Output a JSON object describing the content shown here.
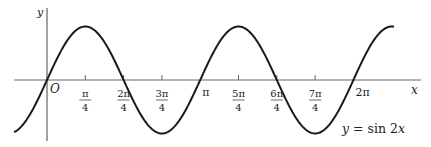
{
  "chart_data": {
    "type": "line",
    "title": "",
    "function_label": "y = sin 2x",
    "xlabel": "x",
    "ylabel": "y",
    "origin_label": "O",
    "x_ticks": [
      {
        "value": 0.7854,
        "num": "π",
        "den": "4"
      },
      {
        "value": 1.5708,
        "num": "2π",
        "den": "4"
      },
      {
        "value": 2.3562,
        "num": "3π",
        "den": "4"
      },
      {
        "value": 3.1416,
        "label": "π"
      },
      {
        "value": 3.927,
        "num": "5π",
        "den": "4"
      },
      {
        "value": 4.7124,
        "num": "6π",
        "den": "4"
      },
      {
        "value": 5.4978,
        "num": "7π",
        "den": "4"
      },
      {
        "value": 6.2832,
        "label": "2π"
      }
    ],
    "series": [
      {
        "name": "y = sin 2x",
        "expression": "sin(2x)",
        "x_range": [
          -0.675,
          7.116
        ]
      }
    ],
    "xlim": [
      -0.85,
      7.34
    ],
    "ylim": [
      -1.1,
      1.1
    ],
    "grid": false,
    "legend": "none",
    "key_points": {
      "zeros": [
        0,
        1.5708,
        3.1416,
        4.7124,
        6.2832
      ],
      "maxima": [
        [
          0.7854,
          1
        ],
        [
          3.927,
          1
        ]
      ],
      "minima": [
        [
          2.3562,
          -1
        ],
        [
          5.4978,
          -1
        ]
      ]
    },
    "colors": {
      "curve": "#1a1a1a",
      "axis": "#555555"
    }
  }
}
